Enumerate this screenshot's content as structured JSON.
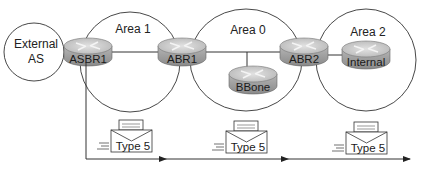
{
  "diagram": {
    "areas": [
      {
        "id": "external",
        "label_lines": [
          "External",
          "AS"
        ]
      },
      {
        "id": "area1",
        "label": "Area 1"
      },
      {
        "id": "area0",
        "label": "Area 0"
      },
      {
        "id": "area2",
        "label": "Area 2"
      }
    ],
    "routers": [
      {
        "id": "asbr1",
        "label": "ASBR1"
      },
      {
        "id": "abr1",
        "label": "ABR1"
      },
      {
        "id": "bbone",
        "label": "BBone"
      },
      {
        "id": "abr2",
        "label": "ABR2"
      },
      {
        "id": "internal",
        "label": "Internal"
      }
    ],
    "lsas": [
      {
        "label": "Type 5"
      },
      {
        "label": "Type 5"
      },
      {
        "label": "Type 5"
      }
    ],
    "colors": {
      "line": "#333333",
      "router_top": "#c9c9c9",
      "router_side": "#9a9a9a"
    }
  }
}
